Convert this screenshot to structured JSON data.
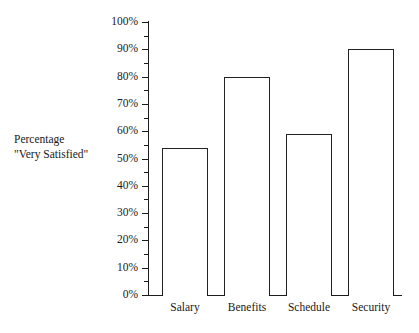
{
  "chart_data": {
    "type": "bar",
    "title": "",
    "xlabel": "",
    "ylabel": "Percentage \"Very Satisfied\"",
    "ylabel_lines": [
      "Percentage",
      "\"Very Satisfied\""
    ],
    "categories": [
      "Salary",
      "Benefits",
      "Schedule",
      "Security"
    ],
    "values": [
      54,
      80,
      59,
      90
    ],
    "value_labels": [
      "54%",
      "80%",
      "59%",
      "90%"
    ],
    "ylim": [
      0,
      100
    ],
    "y_tick_step": 10,
    "y_minor_tick_step": 5,
    "y_tick_labels": [
      "0%",
      "10%",
      "20%",
      "30%",
      "40%",
      "50%",
      "60%",
      "70%",
      "80%",
      "90%",
      "100%"
    ],
    "y_tick_values": [
      0,
      10,
      20,
      30,
      40,
      50,
      60,
      70,
      80,
      90,
      100
    ],
    "grid": false,
    "legend": false,
    "legend_position": "none",
    "series": [
      {
        "name": "Percentage \"Very Satisfied\"",
        "values": [
          54,
          80,
          59,
          90
        ]
      }
    ],
    "style": {
      "bar_fill": "#ffffff",
      "bar_outline": "#232323",
      "axis_color": "#1c1c1c",
      "text_color": "#1a1a1a",
      "background": "#ffffff"
    }
  }
}
